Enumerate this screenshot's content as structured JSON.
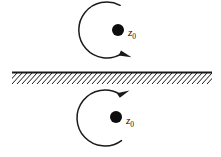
{
  "figure": {
    "type": "diagram",
    "canvas": {
      "width": 221,
      "height": 157,
      "background": "#ffffff"
    },
    "ink_color": "#1a1a1a"
  },
  "boundary": {
    "name": "hatched-wall",
    "y": 72,
    "x_start": 12,
    "x_end": 212,
    "line_width": 2,
    "hatch": {
      "direction": "lower-left-to-upper-right",
      "spacing": 5,
      "depth": 10,
      "angle_deg": 45,
      "side": "below"
    }
  },
  "upper": {
    "label": "z",
    "subscript": "0",
    "label_x": 128,
    "label_y": 36,
    "dot": {
      "cx": 118,
      "cy": 30,
      "r": 6
    },
    "arc": {
      "cx": 107,
      "cy": 30,
      "r": 28,
      "start_deg": 62,
      "end_deg": -58,
      "sense": "clockwise",
      "arrow_at": "end-lower-right"
    },
    "arrow": {
      "x": 128,
      "y": 57,
      "rotation_deg": 28
    }
  },
  "lower": {
    "label": "z",
    "subscript": "0",
    "label_x": 126,
    "label_y": 124,
    "dot": {
      "cx": 116,
      "cy": 117,
      "r": 6
    },
    "arc": {
      "cx": 105,
      "cy": 118,
      "r": 28,
      "start_deg": -54,
      "end_deg": 56,
      "sense": "counterclockwise",
      "arrow_at": "end-upper-right"
    },
    "arrow": {
      "x": 126,
      "y": 92,
      "rotation_deg": -30
    }
  }
}
